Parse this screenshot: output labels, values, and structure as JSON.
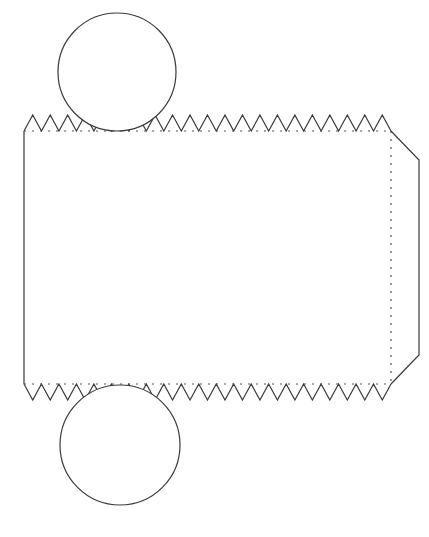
{
  "colors": {
    "stroke": "#3a3a3a",
    "background": "#ffffff",
    "fold": "#555555"
  },
  "net": {
    "body_rect": {
      "x": 24,
      "y": 131,
      "width": 367,
      "height": 253
    },
    "top_circle": {
      "cx": 117,
      "cy": 72,
      "r": 59
    },
    "bottom_circle": {
      "cx": 120,
      "cy": 445,
      "r": 60
    },
    "teeth": {
      "count": 21,
      "height": 16
    },
    "side_flap": {
      "x2": 419,
      "inset": 29
    }
  }
}
